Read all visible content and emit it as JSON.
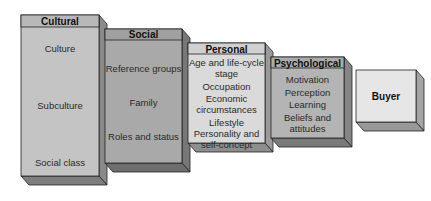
{
  "diagram": {
    "type": "stacked 3D boxes",
    "boxes": [
      {
        "title": "Cultural",
        "items": [
          "Culture",
          "Subculture",
          "Social class"
        ],
        "face_color": "#c4c4c4"
      },
      {
        "title": "Social",
        "items": [
          "Reference groups",
          "Family",
          "Roles and status"
        ],
        "face_color": "#a9a9a9"
      },
      {
        "title": "Personal",
        "items": [
          "Age and life-cycle stage",
          "Occupation",
          "Economic circumstances",
          "Lifestyle",
          "Personality and self-concept"
        ],
        "face_color": "#dadada"
      },
      {
        "title": "Psychological",
        "items": [
          "Motivation",
          "Perception",
          "Learning",
          "Beliefs and attitudes"
        ],
        "face_color": "#b4b4b4"
      },
      {
        "title": "Buyer",
        "items": [],
        "face_color": "#e6e6e6"
      }
    ]
  }
}
